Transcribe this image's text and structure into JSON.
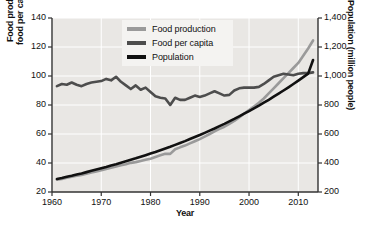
{
  "chart_data": {
    "type": "line",
    "title": "",
    "xlabel": "Year",
    "ylabel_left": "Food production and\nfood per capita (index)",
    "ylabel_left_line1": "Food production and",
    "ylabel_left_line2": "food per capita (index)",
    "ylabel_right": "Population (million people)",
    "xlim": [
      1960,
      2014
    ],
    "ylim_left": [
      20,
      140
    ],
    "ylim_right": [
      200,
      1400
    ],
    "xticks": [
      "1960",
      "1970",
      "1980",
      "1990",
      "2000",
      "2010"
    ],
    "xtick_values": [
      1960,
      1970,
      1980,
      1990,
      2000,
      2010
    ],
    "yticks_left": [
      "20",
      "40",
      "60",
      "80",
      "100",
      "120",
      "140"
    ],
    "ytick_values_left": [
      20,
      40,
      60,
      80,
      100,
      120,
      140
    ],
    "yticks_right": [
      "200",
      "400",
      "600",
      "800",
      "1,000",
      "1,200",
      "1,400"
    ],
    "ytick_values_right": [
      200,
      400,
      600,
      800,
      1000,
      1200,
      1400
    ],
    "grid": true,
    "legend_position": "top-center",
    "plot_background": "#e9e7e4",
    "gridline_color": "#ffffff",
    "series": [
      {
        "name": "Food production",
        "axis": "left",
        "color": "#9a9a9a",
        "x": [
          1961,
          1962,
          1963,
          1964,
          1965,
          1966,
          1967,
          1968,
          1969,
          1970,
          1971,
          1972,
          1973,
          1974,
          1975,
          1976,
          1977,
          1978,
          1979,
          1980,
          1981,
          1982,
          1983,
          1984,
          1985,
          1986,
          1987,
          1988,
          1989,
          1990,
          1991,
          1992,
          1993,
          1994,
          1995,
          1996,
          1997,
          1998,
          1999,
          2000,
          2001,
          2002,
          2003,
          2004,
          2005,
          2006,
          2007,
          2008,
          2009,
          2010,
          2011,
          2012,
          2013
        ],
        "values": [
          28.5,
          29.0,
          29.8,
          30.5,
          31.2,
          31.8,
          32.6,
          33.4,
          34.2,
          35.0,
          35.9,
          36.7,
          37.6,
          38.4,
          39.2,
          40.1,
          40.6,
          41.4,
          42.3,
          43.0,
          44.2,
          45.3,
          46.3,
          46.3,
          49.5,
          50.8,
          52.0,
          53.5,
          55.0,
          56.5,
          58.2,
          60.0,
          61.8,
          63.5,
          65.0,
          67.0,
          69.0,
          71.5,
          74.0,
          76.5,
          79.0,
          81.5,
          84.5,
          88.0,
          91.5,
          95.0,
          98.5,
          102.0,
          105.5,
          109.0,
          114.0,
          119.0,
          124.5
        ]
      },
      {
        "name": "Food per capita",
        "axis": "left",
        "color": "#4d4d4d",
        "x": [
          1961,
          1962,
          1963,
          1964,
          1965,
          1966,
          1967,
          1968,
          1969,
          1970,
          1971,
          1972,
          1973,
          1974,
          1975,
          1976,
          1977,
          1978,
          1979,
          1980,
          1981,
          1982,
          1983,
          1984,
          1985,
          1986,
          1987,
          1988,
          1989,
          1990,
          1991,
          1992,
          1993,
          1994,
          1995,
          1996,
          1997,
          1998,
          1999,
          2000,
          2001,
          2002,
          2003,
          2004,
          2005,
          2006,
          2007,
          2008,
          2009,
          2010,
          2011,
          2012,
          2013
        ],
        "values": [
          93.0,
          94.5,
          94.0,
          95.5,
          94.0,
          93.0,
          94.5,
          95.5,
          96.0,
          96.5,
          98.0,
          97.0,
          99.5,
          96.0,
          93.5,
          91.0,
          93.5,
          90.5,
          92.0,
          89.0,
          86.0,
          85.0,
          84.5,
          80.0,
          85.0,
          83.5,
          83.5,
          85.0,
          86.5,
          85.5,
          86.5,
          88.0,
          89.5,
          88.0,
          86.5,
          87.0,
          90.0,
          91.5,
          92.0,
          92.0,
          92.0,
          92.5,
          94.5,
          97.0,
          99.5,
          100.5,
          101.5,
          101.0,
          100.5,
          101.5,
          102.0,
          102.0,
          102.5
        ]
      },
      {
        "name": "Population",
        "axis": "right",
        "color": "#111111",
        "x": [
          1961,
          1962,
          1963,
          1964,
          1965,
          1966,
          1967,
          1968,
          1969,
          1970,
          1971,
          1972,
          1973,
          1974,
          1975,
          1976,
          1977,
          1978,
          1979,
          1980,
          1981,
          1982,
          1983,
          1984,
          1985,
          1986,
          1987,
          1988,
          1989,
          1990,
          1991,
          1992,
          1993,
          1994,
          1995,
          1996,
          1997,
          1998,
          1999,
          2000,
          2001,
          2002,
          2003,
          2004,
          2005,
          2006,
          2007,
          2008,
          2009,
          2010,
          2011,
          2012,
          2013
        ],
        "values": [
          290,
          297,
          305,
          312,
          320,
          328,
          337,
          346,
          355,
          364,
          373,
          383,
          392,
          402,
          412,
          422,
          432,
          443,
          454,
          465,
          476,
          488,
          500,
          512,
          525,
          538,
          551,
          565,
          579,
          593,
          608,
          623,
          638,
          654,
          670,
          687,
          704,
          722,
          740,
          758,
          777,
          796,
          816,
          836,
          857,
          878,
          900,
          922,
          945,
          968,
          992,
          1016,
          1110
        ]
      }
    ]
  },
  "legend": {
    "items": [
      {
        "label": "Food production",
        "color": "#9a9a9a"
      },
      {
        "label": "Food per capita",
        "color": "#4d4d4d"
      },
      {
        "label": "Population",
        "color": "#111111"
      }
    ]
  },
  "axes": {
    "x_title": "Year",
    "y_left_title_line1": "Food production and",
    "y_left_title_line2": "food per capita (index)",
    "y_right_title": "Population (million people)"
  }
}
